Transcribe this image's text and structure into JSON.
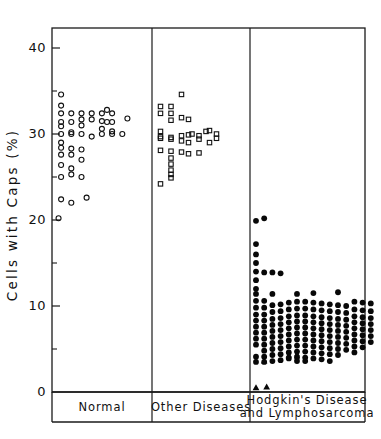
{
  "chart_data": {
    "type": "scatter",
    "title": "",
    "subtitle": "",
    "xlabel": "",
    "ylabel": "Cells  with  Caps  (%)",
    "ylim": [
      0,
      42
    ],
    "ymajor_ticks": [
      0,
      10,
      20,
      30,
      40
    ],
    "yminor_ticks": [
      5,
      15,
      25,
      35
    ],
    "ytick_labels": [
      "0",
      "10",
      "20",
      "30",
      "40"
    ],
    "grid": false,
    "legend": "none",
    "panels": [
      {
        "id": "normal",
        "label": "Normal",
        "marker": "open-circle",
        "n": 47,
        "values": [
          34.6,
          33.3,
          32.4,
          32.4,
          32.4,
          32.4,
          32.4,
          32.8,
          32.4,
          31.4,
          31.4,
          31.7,
          31.7,
          31.5,
          31.4,
          31.4,
          31.8,
          30.9,
          30.2,
          31.0,
          30.6,
          30.3,
          30.0,
          30.0,
          30.0,
          29.7,
          30.0,
          30.0,
          30.0,
          29.0,
          28.4,
          28.3,
          28.2,
          27.6,
          27.6,
          27.0,
          26.4,
          26.0,
          25.0,
          25.3,
          25.0,
          22.4,
          22.0,
          22.6,
          20.2
        ],
        "x_offsets": [
          2,
          2,
          2,
          6,
          10,
          14,
          18,
          20,
          22,
          2,
          6,
          10,
          14,
          18,
          20,
          22,
          28,
          2,
          6,
          10,
          18,
          22,
          2,
          6,
          10,
          14,
          18,
          22,
          26,
          2,
          2,
          6,
          10,
          2,
          6,
          10,
          2,
          6,
          2,
          6,
          10,
          2,
          6,
          12,
          1
        ]
      },
      {
        "id": "other-diseases",
        "label": "Other Diseases",
        "marker": "open-square",
        "n": 36,
        "values": [
          34.6,
          33.2,
          33.2,
          32.4,
          32.4,
          31.9,
          31.6,
          31.7,
          30.3,
          29.7,
          29.6,
          29.8,
          29.9,
          30.0,
          29.8,
          30.3,
          30.4,
          29.5,
          29.4,
          29.2,
          29.0,
          29.4,
          29.0,
          28.1,
          28.0,
          27.9,
          27.7,
          27.8,
          27.2,
          26.5,
          25.8,
          25.3,
          24.2,
          24.9,
          30.0,
          29.5
        ],
        "x_offsets": [
          14,
          2,
          8,
          2,
          8,
          14,
          8,
          18,
          2,
          2,
          8,
          14,
          18,
          20,
          24,
          28,
          30,
          2,
          8,
          14,
          18,
          24,
          30,
          2,
          8,
          14,
          18,
          24,
          8,
          8,
          8,
          8,
          2,
          8,
          34,
          34
        ]
      },
      {
        "id": "hodgkins-lymphosarcoma",
        "label": "Hodgkin's Disease and Lymphosarcoma",
        "label_line1": "Hodgkin's Disease",
        "label_line2": "and Lymphosarcoma",
        "marker": "filled-circle",
        "secondary_marker": "filled-triangle",
        "n": 190,
        "range_note": "0.5 - 20.2",
        "values": [
          19.9,
          20.2,
          17.2,
          16.0,
          15.0,
          14.0,
          14.0,
          14.0,
          13.8,
          13.0,
          12.0,
          11.4,
          11.5,
          11.4,
          11.6,
          11.5,
          10.6,
          10.5,
          10.4,
          10.5,
          10.4,
          10.3,
          10.2,
          10.1,
          9.6,
          0.5,
          0.5
        ],
        "triangle_values": [
          0.5,
          0.5,
          3.6,
          4.4,
          4.3
        ]
      }
    ]
  },
  "axis": {
    "y_label_text": "Cells  with  Caps  (%)"
  }
}
